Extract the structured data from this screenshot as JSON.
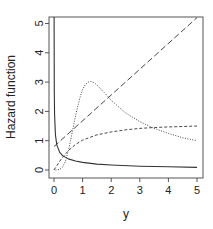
{
  "chart_data": {
    "type": "line",
    "title": "",
    "xlabel": "y",
    "ylabel": "Hazard function",
    "xlim": [
      0,
      5
    ],
    "ylim": [
      0,
      5
    ],
    "xticks": [
      0,
      1,
      2,
      3,
      4,
      5
    ],
    "yticks": [
      0,
      1,
      2,
      3,
      4,
      5
    ],
    "grid": false,
    "legend": null,
    "series": [
      {
        "name": "decreasing",
        "style": "solid",
        "x": [
          0.003,
          0.01,
          0.02,
          0.05,
          0.1,
          0.2,
          0.3,
          0.5,
          0.75,
          1,
          1.5,
          2,
          3,
          4,
          5
        ],
        "y": [
          5.3,
          2.7,
          1.9,
          1.2,
          0.85,
          0.6,
          0.49,
          0.38,
          0.31,
          0.26,
          0.2,
          0.17,
          0.13,
          0.11,
          0.09
        ]
      },
      {
        "name": "linear increasing",
        "style": "longdash",
        "x": [
          0,
          5
        ],
        "y": [
          0.8,
          5.2
        ]
      },
      {
        "name": "increasing saturating",
        "style": "dashed",
        "x": [
          0,
          0.1,
          0.25,
          0.5,
          0.75,
          1,
          1.5,
          2,
          2.5,
          3,
          3.5,
          4,
          5
        ],
        "y": [
          0,
          0.15,
          0.37,
          0.66,
          0.87,
          1.02,
          1.2,
          1.3,
          1.37,
          1.42,
          1.45,
          1.47,
          1.5
        ]
      },
      {
        "name": "unimodal",
        "style": "dotted",
        "x": [
          0.05,
          0.2,
          0.3,
          0.4,
          0.5,
          0.6,
          0.7,
          0.8,
          0.9,
          1.0,
          1.1,
          1.2,
          1.3,
          1.4,
          1.5,
          1.75,
          2.0,
          2.5,
          3.0,
          3.5,
          4.0,
          4.5,
          5.0
        ],
        "y": [
          0,
          0.02,
          0.1,
          0.3,
          0.65,
          1.1,
          1.6,
          2.05,
          2.45,
          2.75,
          2.92,
          3.0,
          3.02,
          2.98,
          2.9,
          2.65,
          2.38,
          1.95,
          1.65,
          1.42,
          1.25,
          1.1,
          1.0
        ]
      }
    ]
  },
  "layout": {
    "box": {
      "left": 49,
      "top": 17,
      "right": 203,
      "bottom": 178
    },
    "x_px": [
      54,
      197
    ],
    "y_px": [
      170,
      23.5
    ],
    "line_color": "#333333",
    "axis_color": "#555555"
  }
}
